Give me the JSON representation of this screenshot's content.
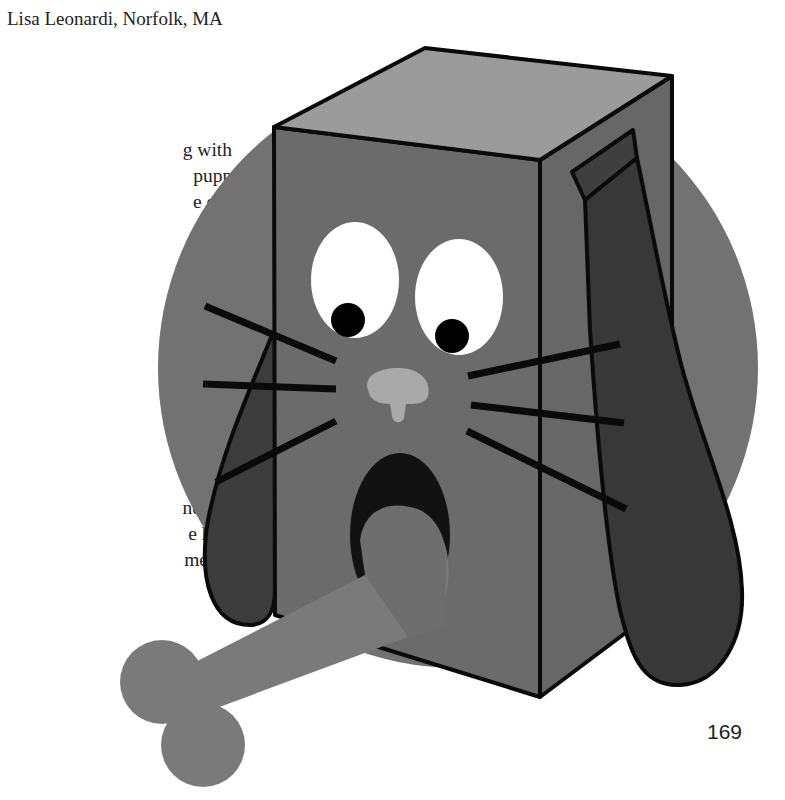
{
  "page": {
    "credit": "Lisa Leonardi, Norfolk, MA",
    "page_number": "169"
  },
  "body_text": {
    "lines": [
      {
        "text": "g with",
        "top": 152,
        "right": 98
      },
      {
        "text": "puppy",
        "top": 178,
        "right": 88
      },
      {
        "text": "e entire",
        "top": 204,
        "right": 79
      },
      {
        "text": ". Stand",
        "top": 230,
        "right": 74
      },
      {
        "text": "py by",
        "top": 256,
        "right": 88
      },
      {
        "text": "nd a",
        "top": 282,
        "right": 101
      },
      {
        "text": "resemble",
        "top": 308,
        "right": 61
      },
      {
        "text": "at is large",
        "top": 334,
        "right": 50
      },
      {
        "text": ". supply",
        "top": 360,
        "right": 75
      },
      {
        "text": "group.",
        "top": 432,
        "right": 86
      },
      {
        "text": ". What",
        "top": 458,
        "right": 89
      },
      {
        "text": "t those",
        "top": 484,
        "right": 83
      },
      {
        "text": "ne",
        "top": 510,
        "right": 129
      },
      {
        "text": "e hungry",
        "top": 536,
        "right": 73
      },
      {
        "text": "merals,",
        "top": 562,
        "right": 89
      }
    ]
  },
  "illustration": {
    "subject": "puppy tissue-box craft with bone",
    "colors": {
      "circle": "#6f6f6f",
      "box_front": "#6a6a6a",
      "box_top": "#9a9a9a",
      "box_side": "#666666",
      "ear": "#3a3a3a",
      "eye_white": "#ffffff",
      "pupil": "#000000",
      "nose": "#a8a8a8",
      "mouth": "#111111",
      "bone": "#7a7a7a",
      "outline": "#0a0a0a"
    }
  }
}
